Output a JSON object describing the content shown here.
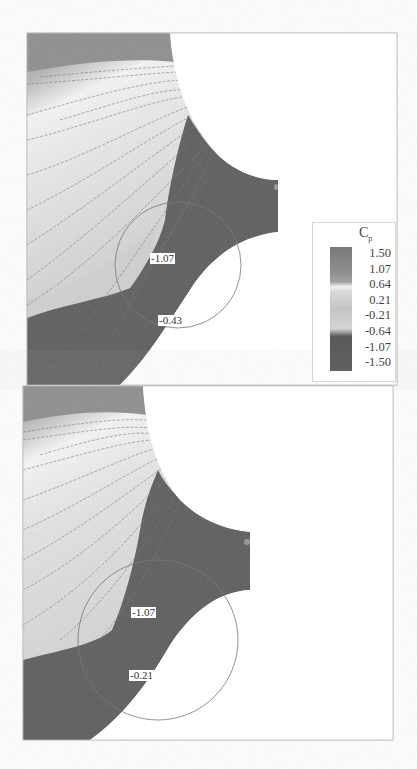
{
  "figure": {
    "variable": "C",
    "variable_subscript": "p",
    "panels": [
      {
        "id": "top",
        "annotations": [
          {
            "text": "-1.07",
            "x": 150,
            "y": 253
          },
          {
            "text": "-0.43",
            "x": 158,
            "y": 315
          }
        ]
      },
      {
        "id": "bottom",
        "annotations": [
          {
            "text": "-1.07",
            "x": 131,
            "y": 607
          },
          {
            "text": "-0.21",
            "x": 129,
            "y": 670
          }
        ]
      }
    ],
    "legend": {
      "title": "C",
      "subscript": "p",
      "ticks": [
        "1.50",
        "1.07",
        "0.64",
        "0.21",
        "-0.21",
        "-0.64",
        "-1.07",
        "-1.50"
      ],
      "colors": [
        "#7a7a7a",
        "#8e8e8e",
        "#e8e8e8",
        "#c4c4c4",
        "#b8b8b8",
        "#5a5a5a",
        "#555555",
        "#606060"
      ]
    }
  }
}
